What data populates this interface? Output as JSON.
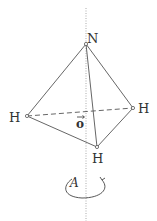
{
  "diagram": {
    "type": "molecular-geometry",
    "molecule": "NH3",
    "atoms": [
      {
        "id": "N",
        "label": "N",
        "x": 86,
        "y": 44
      },
      {
        "id": "H1",
        "label": "H",
        "x": 27,
        "y": 116
      },
      {
        "id": "H2",
        "label": "H",
        "x": 133,
        "y": 108
      },
      {
        "id": "H3",
        "label": "H",
        "x": 97,
        "y": 147
      }
    ],
    "bonds": [
      {
        "from": "N",
        "to": "H1",
        "style": "solid"
      },
      {
        "from": "N",
        "to": "H2",
        "style": "solid"
      },
      {
        "from": "N",
        "to": "H3",
        "style": "solid"
      },
      {
        "from": "H1",
        "to": "H3",
        "style": "solid"
      },
      {
        "from": "H3",
        "to": "H2",
        "style": "solid"
      },
      {
        "from": "H1",
        "to": "H2",
        "style": "dashed"
      }
    ],
    "axis": {
      "style": "dotted",
      "x": 86,
      "y_start": 8,
      "y_end": 221
    },
    "origin_label": "o",
    "rotation_label": "A",
    "colors": {
      "line": "#555555",
      "axis": "#aaaaaa",
      "text": "#333333"
    }
  }
}
